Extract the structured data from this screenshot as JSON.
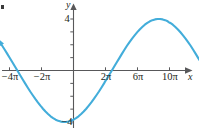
{
  "figure": {
    "background_color": "#ffffff",
    "corner_mark": "·"
  },
  "chart_data": {
    "type": "line",
    "title": "",
    "subtitle": "",
    "xlabel": "x",
    "ylabel": "y",
    "grid": false,
    "legend": null,
    "xlim": [
      -14.5,
      35.5
    ],
    "ylim": [
      -5.6,
      5.6
    ],
    "x_unit": "pi",
    "x_tick_labels": [
      "−4π",
      "−2π",
      "2π",
      "6π",
      "10π"
    ],
    "x_tick_values": [
      -12.566,
      -6.283,
      6.283,
      18.85,
      31.416
    ],
    "x_minor_tick_values": [
      -12.566,
      -6.283,
      6.283,
      12.566,
      18.85,
      25.133,
      31.416
    ],
    "y_tick_labels": [
      "4",
      "−4"
    ],
    "y_tick_values": [
      4,
      -4
    ],
    "y_minor_tick_values": [
      -4,
      -3,
      -2,
      -1,
      1,
      2,
      3,
      4
    ],
    "function": "y = 4 sin(x/4)",
    "amplitude": 4,
    "period": "8π",
    "zeros": [
      "−4π",
      "0",
      "4π",
      "8π"
    ],
    "maxima": [
      {
        "x": "2π",
        "y": 4
      },
      {
        "x": "10π",
        "y": 4
      }
    ],
    "minima": [
      {
        "x": "−2π",
        "y": -4
      },
      {
        "x": "6π",
        "y": -4
      }
    ],
    "curve_color": "#43adda",
    "axis_color": "#58585a",
    "x": [
      -14.5,
      -14.0,
      -13.5,
      -13.0,
      -12.566,
      -12.0,
      -11.5,
      -11.0,
      -10.5,
      -10.0,
      -9.5,
      -9.0,
      -8.5,
      -8.0,
      -7.5,
      -7.0,
      -6.5,
      -6.283,
      -6.0,
      -5.5,
      -5.0,
      -4.5,
      -4.0,
      -3.5,
      -3.0,
      -2.5,
      -2.0,
      -1.5,
      -1.0,
      -0.5,
      0.0,
      0.5,
      1.0,
      1.5,
      2.0,
      2.5,
      3.0,
      3.5,
      4.0,
      4.5,
      5.0,
      5.5,
      6.0,
      6.283,
      6.5,
      7.0,
      7.5,
      8.0,
      8.5,
      9.0,
      9.5,
      10.0,
      10.5,
      11.0,
      11.5,
      12.0,
      12.566,
      13.0,
      13.5,
      14.0,
      14.5,
      15.0,
      15.5,
      16.0,
      16.5,
      17.0,
      17.5,
      18.0,
      18.5,
      18.85,
      19.0,
      19.5,
      20.0,
      20.5,
      21.0,
      21.5,
      22.0,
      22.5,
      23.0,
      23.5,
      24.0,
      24.5,
      25.0,
      25.133,
      25.5,
      26.0,
      26.5,
      27.0,
      27.5,
      28.0,
      28.5,
      29.0,
      29.5,
      30.0,
      30.5,
      31.0,
      31.416,
      32.0,
      32.5,
      33.0,
      33.5,
      34.0,
      34.5,
      35.0,
      35.5
    ],
    "y": [
      2.22,
      1.92,
      1.61,
      1.29,
      1.01,
      0.64,
      0.31,
      -0.02,
      -0.35,
      -0.68,
      -1.0,
      -1.32,
      -1.63,
      -1.92,
      -2.21,
      -2.48,
      -2.73,
      -2.83,
      -2.97,
      -3.19,
      -3.38,
      -3.56,
      -3.7,
      -3.82,
      -3.91,
      -3.97,
      -4.0,
      -4.0,
      -3.97,
      -3.91,
      -3.82,
      -3.7,
      -3.56,
      -3.38,
      -3.19,
      -2.97,
      -2.73,
      -2.48,
      -2.21,
      -1.92,
      -1.63,
      -1.32,
      -1.0,
      -0.8,
      -0.68,
      -0.35,
      -0.02,
      0.31,
      0.64,
      0.96,
      1.29,
      1.61,
      1.92,
      2.21,
      2.48,
      2.73,
      3.0,
      3.19,
      3.38,
      3.56,
      3.7,
      3.82,
      3.91,
      3.97,
      4.0,
      4.0,
      3.97,
      3.91,
      3.82,
      3.71,
      3.7,
      3.56,
      3.38,
      3.19,
      2.97,
      2.73,
      2.48,
      2.21,
      1.92,
      1.61,
      1.29,
      0.96,
      0.64,
      0.55,
      0.31,
      -0.02,
      -0.35,
      -0.68,
      -1.0,
      -1.32,
      -1.63,
      -1.92,
      -2.21,
      -2.48,
      -2.73,
      -2.97,
      -3.18,
      -3.46,
      -3.62,
      -3.76,
      -3.86,
      -3.94,
      -3.98,
      -4.0,
      -4.0
    ]
  }
}
